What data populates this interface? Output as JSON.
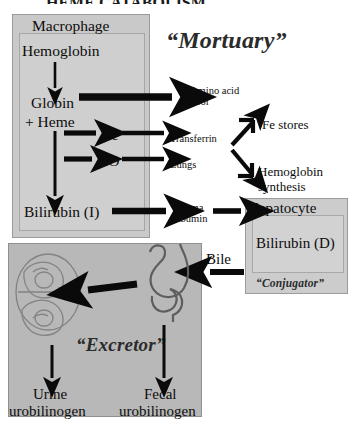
{
  "diagram": {
    "title_partial": "HEME CATABOLISM",
    "panels": {
      "macrophage": {
        "label": "Macrophage",
        "role_quote": "“Mortuary”",
        "nodes": [
          "Hemoglobin",
          "Globin",
          "+ Heme",
          "Bilirubin (I)"
        ],
        "branches": [
          "Fe",
          "CO"
        ]
      },
      "hepatocyte": {
        "label": "Hepatocyte",
        "inner_label": "Bilirubin (D)",
        "role_quote": "“Conjugator”"
      },
      "excretor": {
        "role_quote": "“Excretor”",
        "organs": [
          "kidney",
          "stomach-intestine"
        ],
        "outputs": [
          "Urine urobilinogen",
          "Fecal urobilinogen"
        ],
        "output_lines": [
          [
            "Urine",
            "urobilinogen"
          ],
          [
            "Fecal",
            "urobilinogen"
          ]
        ]
      }
    },
    "external_nodes": {
      "amino_acid_pool": [
        "Amino acid",
        "pool"
      ],
      "transferrin": "Transferrin",
      "lungs": "Lungs",
      "fe_stores": "Fe stores",
      "hemoglobin_synthesis": [
        "Hemoglobin",
        "synthesis"
      ],
      "plasma_albumin": [
        "Plasma",
        "albumin"
      ],
      "bile": "Bile"
    },
    "colors": {
      "macrophage_fill": "#c9c9c9",
      "macrophage_inner_fill": "#cfcfcf",
      "hepatocyte_fill": "#cccccc",
      "hepatocyte_inner_fill": "#d2d2d2",
      "excretor_fill": "#b8b8b8",
      "arrow": "#0a0a0a",
      "text": "#0d0d0d",
      "quote_text": "#2b2b2b",
      "page_background": "#ffffff"
    },
    "arrow_flows": [
      {
        "from": "Hemoglobin",
        "to": "Globin + Heme",
        "style": "thin-vertical"
      },
      {
        "from": "Globin",
        "to": "Amino acid pool",
        "style": "thick-horizontal"
      },
      {
        "from": "Heme",
        "to": "Fe",
        "style": "thick-short"
      },
      {
        "from": "Heme",
        "to": "CO",
        "style": "thick-short"
      },
      {
        "from": "Fe",
        "to": "Transferrin",
        "style": "thick-short"
      },
      {
        "from": "CO",
        "to": "Lungs",
        "style": "thick-short"
      },
      {
        "from": "Transferrin",
        "to": "Fe stores",
        "style": "bracket-up"
      },
      {
        "from": "Transferrin",
        "to": "Hemoglobin synthesis",
        "style": "bracket-down"
      },
      {
        "from": "Heme",
        "to": "Bilirubin (I)",
        "style": "thin-long-vertical"
      },
      {
        "from": "Bilirubin (I)",
        "to": "Plasma albumin",
        "style": "thick-horizontal"
      },
      {
        "from": "Plasma albumin",
        "to": "Hepatocyte",
        "style": "thick-horizontal"
      },
      {
        "from": "Bilirubin (D)",
        "to": "Bile",
        "style": "thick-left"
      },
      {
        "from": "Bile",
        "to": "Intestine",
        "style": "thick-left"
      },
      {
        "from": "Intestine",
        "to": "Kidney",
        "style": "thick-left"
      },
      {
        "from": "Kidney",
        "to": "Urine urobilinogen",
        "style": "thin-vertical"
      },
      {
        "from": "Intestine",
        "to": "Fecal urobilinogen",
        "style": "thin-vertical"
      }
    ]
  }
}
